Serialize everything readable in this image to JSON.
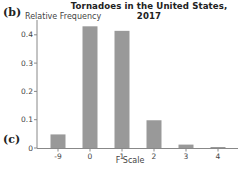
{
  "panel_labels": {
    "top": "(b)",
    "bottom": "(c)"
  },
  "chart_data": {
    "type": "bar",
    "title": "Tornadoes in the United States, 2017",
    "xlabel": "F Scale",
    "ylabel": "Relative Frequency",
    "categories": [
      "-9",
      "0",
      "1",
      "2",
      "3",
      "4"
    ],
    "values": [
      0.048,
      0.43,
      0.414,
      0.098,
      0.012,
      0.002
    ],
    "yticks": [
      "0",
      "0.1",
      "0.2",
      "0.3",
      "0.4"
    ],
    "ylim": [
      0,
      0.44
    ],
    "grid": false,
    "bar_color": "#999999",
    "legend": null
  }
}
